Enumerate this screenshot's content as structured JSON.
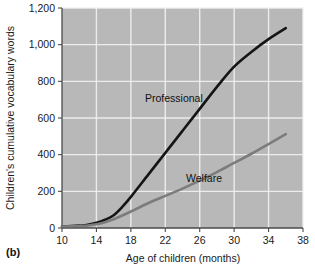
{
  "figure": {
    "panel_label": "(b)",
    "background_color": "#b8b8b8",
    "gridline_color": "#f2f2f2",
    "axis_color": "#4a4a4a"
  },
  "chart_data": {
    "type": "line",
    "title": "",
    "xlabel": "Age of children (months)",
    "ylabel": "Children's cumulative vocabulary words",
    "xlim": [
      10,
      38
    ],
    "ylim": [
      0,
      1200
    ],
    "xticks": [
      "10",
      "14",
      "18",
      "22",
      "26",
      "30",
      "34",
      "38"
    ],
    "xtick_values": [
      10,
      14,
      18,
      22,
      26,
      30,
      34,
      38
    ],
    "yticks": [
      "0",
      "200",
      "400",
      "600",
      "800",
      "1,000",
      "1,200"
    ],
    "ytick_values": [
      0,
      200,
      400,
      600,
      800,
      1000,
      1200
    ],
    "grid": true,
    "legend": "inline-labels",
    "series": [
      {
        "name": "Professional",
        "color": "#151515",
        "label_x": 23.0,
        "label_y": 690,
        "x": [
          10,
          11,
          12,
          13,
          14,
          15,
          16,
          17,
          18,
          20,
          22,
          24,
          26,
          28,
          30,
          32,
          34,
          36
        ],
        "values": [
          8,
          10,
          13,
          18,
          28,
          45,
          70,
          115,
          170,
          290,
          410,
          530,
          650,
          770,
          880,
          960,
          1030,
          1090
        ]
      },
      {
        "name": "Welfare",
        "color": "#7c7c7c",
        "label_x": 26.5,
        "label_y": 250,
        "x": [
          10,
          11,
          12,
          13,
          14,
          15,
          16,
          17,
          18,
          20,
          22,
          24,
          26,
          28,
          30,
          32,
          34,
          36
        ],
        "values": [
          8,
          9,
          11,
          14,
          20,
          32,
          48,
          68,
          90,
          135,
          175,
          215,
          258,
          305,
          355,
          405,
          458,
          512
        ]
      }
    ]
  }
}
